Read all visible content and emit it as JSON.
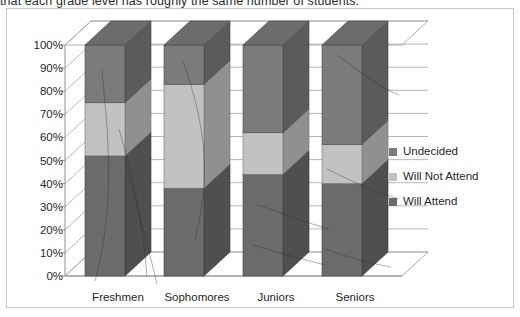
{
  "page": {
    "cutoff_text": "that each grade level has roughly the same number of students."
  },
  "legend": {
    "position": "right",
    "items": [
      {
        "label": "Undecided",
        "color": "#7b7b7b"
      },
      {
        "label": "Will Not Attend",
        "color": "#c2c2c2"
      },
      {
        "label": "Will Attend",
        "color": "#6b6b6b"
      }
    ]
  },
  "axis": {
    "y_ticks": [
      "100%",
      "90%",
      "80%",
      "70%",
      "60%",
      "50%",
      "40%",
      "30%",
      "20%",
      "10%",
      "0%"
    ],
    "x_ticks": [
      "Freshmen",
      "Sophomores",
      "Juniors",
      "Seniors"
    ]
  },
  "chart_data": {
    "type": "bar",
    "subtype": "100% stacked column (3-D)",
    "title": "",
    "subtitle": "",
    "xlabel": "",
    "ylabel": "",
    "ylim": [
      0,
      100
    ],
    "ytick_labels": [
      "0%",
      "10%",
      "20%",
      "30%",
      "40%",
      "50%",
      "60%",
      "70%",
      "80%",
      "90%",
      "100%"
    ],
    "grid": true,
    "legend_position": "right",
    "categories": [
      "Freshmen",
      "Sophomores",
      "Juniors",
      "Seniors"
    ],
    "series": [
      {
        "name": "Will Attend",
        "color": "#6b6b6b",
        "values": [
          52,
          38,
          44,
          40
        ]
      },
      {
        "name": "Will Not Attend",
        "color": "#c2c2c2",
        "values": [
          23,
          45,
          18,
          17
        ]
      },
      {
        "name": "Undecided",
        "color": "#7b7b7b",
        "values": [
          25,
          17,
          38,
          43
        ]
      }
    ],
    "stack_order_bottom_to_top": [
      "Will Attend",
      "Will Not Attend",
      "Undecided"
    ]
  }
}
